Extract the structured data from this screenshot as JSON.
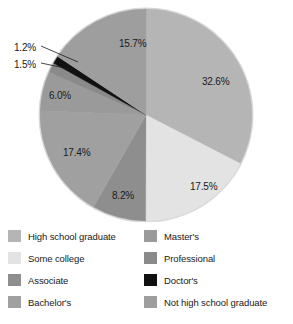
{
  "chart_data": {
    "type": "pie",
    "title": "",
    "categories": [
      "High school graduate",
      "Some college",
      "Associate",
      "Bachelor's",
      "Master's",
      "Professional",
      "Doctor's",
      "Not high school graduate"
    ],
    "values": [
      32.6,
      17.5,
      8.2,
      17.4,
      6.0,
      1.5,
      1.2,
      15.7
    ],
    "value_labels": [
      "32.6%",
      "17.5%",
      "8.2%",
      "17.4%",
      "6.0%",
      "1.5%",
      "1.2%",
      "15.7%"
    ],
    "colors": [
      "#b5b5b5",
      "#e3e3e3",
      "#8e8e8e",
      "#a0a0a0",
      "#9a9a9a",
      "#8a8a8a",
      "#111111",
      "#9e9e9e"
    ],
    "unit": "%",
    "start_angle_deg": 0,
    "direction": "clockwise",
    "legend_position": "bottom",
    "grid": false,
    "callout_slices": [
      "Professional",
      "Doctor's"
    ]
  },
  "slice_labels": [
    {
      "text": "32.6%",
      "x": 202,
      "y": 76
    },
    {
      "text": "17.5%",
      "x": 190,
      "y": 181
    },
    {
      "text": "8.2%",
      "x": 112,
      "y": 190
    },
    {
      "text": "17.4%",
      "x": 63,
      "y": 147
    },
    {
      "text": "6.0%",
      "x": 49,
      "y": 90
    },
    {
      "text": "1.5%",
      "x": 14,
      "y": 59
    },
    {
      "text": "1.2%",
      "x": 14,
      "y": 42
    },
    {
      "text": "15.7%",
      "x": 119,
      "y": 38
    }
  ],
  "legend": {
    "left_column": [
      {
        "label": "High school graduate",
        "color": "#b5b5b5"
      },
      {
        "label": "Some college",
        "color": "#e3e3e3"
      },
      {
        "label": "Associate",
        "color": "#8e8e8e"
      },
      {
        "label": "Bachelor's",
        "color": "#a0a0a0"
      }
    ],
    "right_column": [
      {
        "label": "Master's",
        "color": "#9a9a9a"
      },
      {
        "label": "Professional",
        "color": "#8a8a8a"
      },
      {
        "label": "Doctor's",
        "color": "#111111"
      },
      {
        "label": "Not high school graduate",
        "color": "#9e9e9e"
      }
    ]
  }
}
